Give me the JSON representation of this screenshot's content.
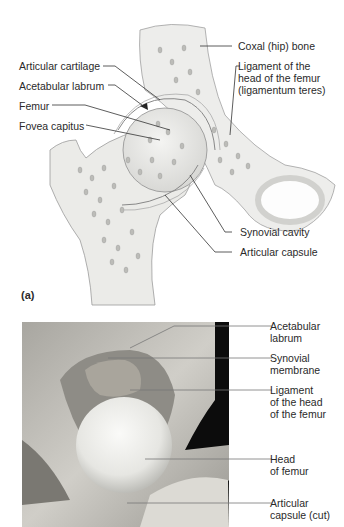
{
  "figure": {
    "panel_a": {
      "letter": "(a)",
      "labels_left": [
        {
          "id": "articular-cartilage",
          "text": "Articular cartilage"
        },
        {
          "id": "acetabular-labrum",
          "text": "Acetabular labrum"
        },
        {
          "id": "femur",
          "text": "Femur"
        },
        {
          "id": "fovea-capitus",
          "text": "Fovea capitus"
        }
      ],
      "labels_right": [
        {
          "id": "coxal-bone",
          "text": "Coxal (hip) bone"
        },
        {
          "id": "ligament-head-femur",
          "lines": [
            "Ligament of the",
            "head of the femur",
            "(ligamentum teres)"
          ]
        },
        {
          "id": "synovial-cavity",
          "text": "Synovial cavity"
        },
        {
          "id": "articular-capsule",
          "text": "Articular capsule"
        }
      ]
    },
    "panel_b": {
      "labels_right": [
        {
          "id": "acetabular-labrum",
          "lines": [
            "Acetabular",
            "labrum"
          ]
        },
        {
          "id": "synovial-membrane",
          "lines": [
            "Synovial",
            "membrane"
          ]
        },
        {
          "id": "ligament-head-femur",
          "lines": [
            "Ligament",
            "of the head",
            "of the femur"
          ]
        },
        {
          "id": "head-of-femur",
          "lines": [
            "Head",
            "of femur"
          ]
        },
        {
          "id": "articular-capsule-cut",
          "lines": [
            "Articular",
            "capsule (cut)"
          ]
        }
      ]
    }
  },
  "colors": {
    "bone_fill": "#ececea",
    "bone_stroke": "#9a9a9a",
    "leader": "#333333",
    "photo_dark": "#0a0a0a",
    "photo_tissue": "#b8b6b0",
    "femoral_head": "#eeeeea"
  }
}
